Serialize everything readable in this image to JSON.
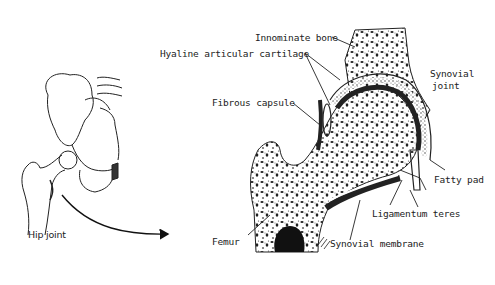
{
  "diagram": {
    "left_figure": {
      "label": "Hip joint",
      "arrow": "points from pelvis sketch to enlarged cross-section"
    },
    "labels": [
      {
        "id": "innominate",
        "text": "Innominate bone"
      },
      {
        "id": "hyaline",
        "text": "Hyaline articular cartilage"
      },
      {
        "id": "synovial_joint_1",
        "text": "Synovial"
      },
      {
        "id": "synovial_joint_2",
        "text": "joint"
      },
      {
        "id": "fibrous",
        "text": "Fibrous capsule"
      },
      {
        "id": "fatty",
        "text": "Fatty pad"
      },
      {
        "id": "ligamentum",
        "text": "Ligamentum teres"
      },
      {
        "id": "femur",
        "text": "Femur"
      },
      {
        "id": "synovial_membrane",
        "text": "Synovial membrane"
      },
      {
        "id": "hip",
        "text": "Hip joint"
      }
    ],
    "colors": {
      "ink": "#1a1a1a",
      "background": "#ffffff"
    }
  }
}
